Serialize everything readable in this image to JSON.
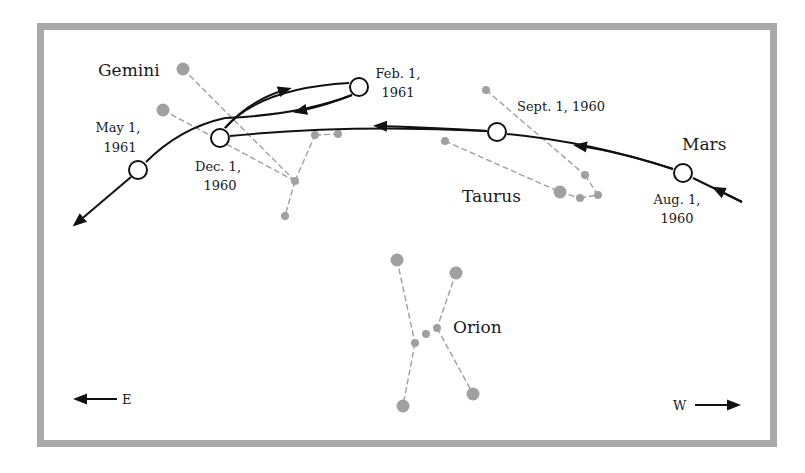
{
  "diagram": {
    "planet": "Mars",
    "constellations": [
      {
        "name": "Gemini",
        "label_pos": [
          98,
          76
        ]
      },
      {
        "name": "Taurus",
        "label_pos": [
          462,
          202
        ]
      },
      {
        "name": "Orion",
        "label_pos": [
          452,
          333
        ]
      }
    ],
    "dates": [
      {
        "line1": "Aug. 1,",
        "line2": "1960",
        "pos": [
          683,
          173
        ]
      },
      {
        "line1": "Sept. 1, 1960",
        "line2": "",
        "pos": [
          497,
          132
        ]
      },
      {
        "line1": "Dec. 1,",
        "line2": "1960",
        "pos": [
          220,
          138
        ]
      },
      {
        "line1": "Feb. 1,",
        "line2": "1961",
        "pos": [
          359,
          87
        ]
      },
      {
        "line1": "May 1,",
        "line2": "1961",
        "pos": [
          138,
          170
        ]
      }
    ],
    "directions": {
      "east": "E",
      "west": "W"
    },
    "colors": {
      "frame": "#a9a9a9",
      "star": "#a0a0a0",
      "path": "#111111"
    }
  }
}
